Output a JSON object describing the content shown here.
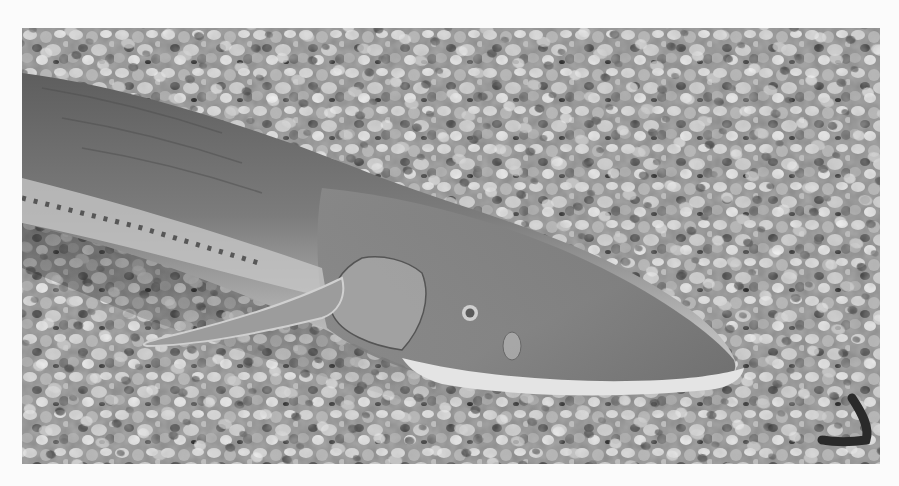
{
  "image": {
    "description": "Black-and-white photograph of a sturgeon-like fish (shovelnose sturgeon) lying on aquarium gravel",
    "style": "grayscale photograph with white page margin",
    "subject": "fish",
    "background": "gravel",
    "colors": {
      "page": "#fbfbfb",
      "gravel_light": "#d8d8d8",
      "gravel_mid": "#9a9a9a",
      "gravel_dark": "#3a3a3a",
      "fish_body": "#8e8e8e",
      "fish_back": "#6e6e6e",
      "fish_belly": "#c8c8c8",
      "snout_edge": "#e6e6e6",
      "eye": "#5a5a5a"
    }
  }
}
